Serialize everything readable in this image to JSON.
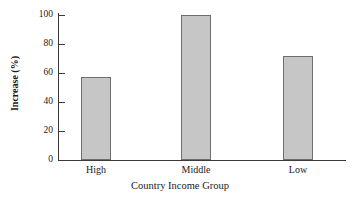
{
  "chart_data": {
    "type": "bar",
    "title": "",
    "xlabel": "Country Income Group",
    "ylabel": "Increase (%)",
    "categories": [
      "High",
      "Middle",
      "Low"
    ],
    "values": [
      57,
      100,
      72
    ],
    "ylim": [
      0,
      100
    ],
    "yticks": [
      0,
      20,
      40,
      60,
      80,
      100
    ],
    "ytick_labels": [
      "0",
      "20",
      "40",
      "60",
      "80",
      "100"
    ],
    "grid": false,
    "legend": null,
    "bar_color": "#c6c6c6",
    "bar_edge_color": "#6e6e6e",
    "axis_color": "#3a3a3a",
    "background": "#ffffff"
  }
}
